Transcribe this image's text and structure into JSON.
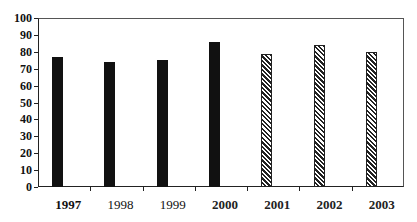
{
  "chart_data": {
    "type": "bar",
    "title": "",
    "xlabel": "",
    "ylabel": "",
    "categories": [
      "1997",
      "1998",
      "1999",
      "2000",
      "2001",
      "2002",
      "2003"
    ],
    "values": [
      77,
      74,
      75,
      86,
      79,
      84,
      80
    ],
    "bar_styles": [
      "solid",
      "solid",
      "solid",
      "solid",
      "hatched",
      "hatched",
      "hatched"
    ],
    "label_weights": [
      "bold",
      "normal",
      "normal",
      "semi",
      "semi",
      "semi",
      "semi"
    ],
    "ylim": [
      0,
      100
    ],
    "yticks": [
      "100",
      "90",
      "80",
      "70",
      "60",
      "50",
      "40",
      "30",
      "20",
      "10",
      "0"
    ],
    "grid": false,
    "legend": null,
    "colors": {
      "solid": "#111111",
      "hatch": "#222222",
      "background": "#ffffff"
    }
  }
}
